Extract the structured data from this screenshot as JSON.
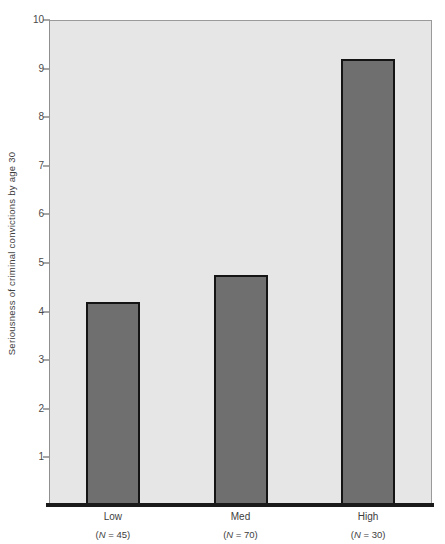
{
  "chart_data": {
    "type": "bar",
    "title": "",
    "subtitle": "",
    "xlabel": "",
    "ylabel": "Seriousness of criminal convictions by age 30",
    "categories": [
      "Low",
      "Med",
      "High"
    ],
    "category_sublabels": [
      "(N = 45)",
      "(N = 70)",
      "(N = 30)"
    ],
    "group_sizes": [
      45,
      70,
      30
    ],
    "values": [
      4.2,
      4.75,
      9.2
    ],
    "series": [
      {
        "name": "Seriousness of criminal convictions by age 30",
        "values": [
          4.2,
          4.75,
          9.2
        ]
      }
    ],
    "ylim": [
      0,
      10
    ],
    "ytick_values": [
      1,
      2,
      3,
      4,
      5,
      6,
      7,
      8,
      9,
      10
    ],
    "ytick_labels": [
      "1",
      "2",
      "3",
      "4",
      "5",
      "6",
      "7",
      "8",
      "9",
      "10"
    ],
    "grid": false,
    "legend": "none",
    "colors": {
      "bar_fill": "#6f6f6f",
      "bar_edge": "#141414",
      "plot_background": "#e6e6e6",
      "axis": "#1a1a1a",
      "text": "#3d3d3d",
      "figure_background": "#ffffff"
    }
  }
}
